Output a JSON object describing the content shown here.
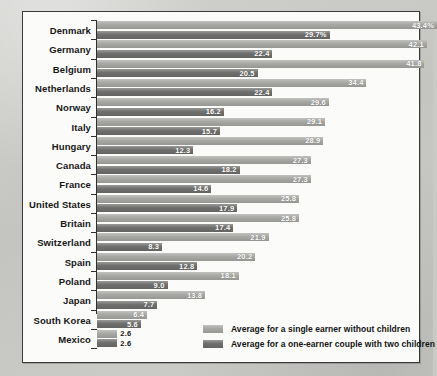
{
  "chart_data": {
    "type": "bar",
    "orientation": "horizontal",
    "title": "",
    "subtitle": "",
    "xlabel": "",
    "ylabel": "",
    "grid": false,
    "legend_position": "bottom-right",
    "xlim": [
      0,
      43.4
    ],
    "value_suffix_first_row": "%",
    "categories": [
      "Denmark",
      "Germany",
      "Belgium",
      "Netherlands",
      "Norway",
      "Italy",
      "Hungary",
      "Canada",
      "France",
      "United States",
      "Britain",
      "Switzerland",
      "Spain",
      "Poland",
      "Japan",
      "South Korea",
      "Mexico"
    ],
    "series": [
      {
        "name": "Average for a single earner without children",
        "color": "#a7a7a4",
        "values": [
          43.4,
          42.1,
          41.8,
          34.4,
          29.6,
          29.1,
          28.9,
          27.3,
          27.3,
          25.8,
          25.8,
          21.9,
          20.2,
          18.1,
          13.8,
          6.4,
          2.6
        ],
        "labels": [
          "43.4%",
          "42.1",
          "41.8",
          "34.4",
          "29.6",
          "29.1",
          "28.9",
          "27.3",
          "27.3",
          "25.8",
          "25.8",
          "21.9",
          "20.2",
          "18.1",
          "13.8",
          "6.4",
          "2.6"
        ]
      },
      {
        "name": "Average for a one-earner couple with two children",
        "color": "#6f6f6d",
        "values": [
          29.7,
          22.4,
          20.5,
          22.4,
          16.2,
          15.7,
          12.3,
          18.2,
          14.6,
          17.9,
          17.4,
          8.3,
          12.8,
          9.0,
          7.7,
          5.6,
          2.6
        ],
        "labels": [
          "29.7%",
          "22.4",
          "20.5",
          "22.4",
          "16.2",
          "15.7",
          "12.3",
          "18.2",
          "14.6",
          "17.9",
          "17.4",
          "8.3",
          "12.8",
          "9.0",
          "7.7",
          "5.6",
          "2.6"
        ]
      }
    ]
  },
  "legend": {
    "items": [
      {
        "label": "Average for a single earner without children",
        "color": "#a7a7a4"
      },
      {
        "label": "Average for a one-earner couple with two children",
        "color": "#6f6f6d"
      }
    ]
  },
  "colors": {
    "page_background": "#c9c9c6",
    "panel_background": "#fbfbfa",
    "panel_border": "#3a3a3a",
    "series_light": "#a7a7a4",
    "series_dark": "#6f6f6d",
    "label_text": "#171717",
    "value_text_inside": "#ffffff",
    "value_text_outside": "#151515"
  }
}
